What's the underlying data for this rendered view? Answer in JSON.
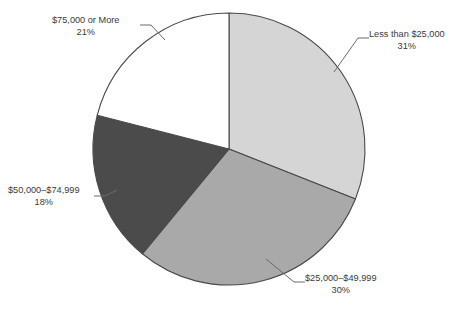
{
  "chart_data": {
    "type": "pie",
    "title": "",
    "subtitle": "",
    "xlabel": "",
    "ylabel": "",
    "legend_position": "none",
    "grid": false,
    "start_angle_deg": 0,
    "direction": "clockwise",
    "categories": [
      "Less than $25,000",
      "$25,000–$49,999",
      "$50,000–$74,999",
      "$75,000 or More"
    ],
    "values": [
      31,
      30,
      18,
      21
    ],
    "value_labels": [
      "31%",
      "30%",
      "18%",
      "21%"
    ],
    "colors": [
      "#d5d5d5",
      "#a9a9a9",
      "#4b4b4b",
      "#ffffff"
    ],
    "slices": [
      {
        "label": "Less than $25,000",
        "percent_label": "31%",
        "value": 31,
        "color": "#d5d5d5"
      },
      {
        "label": "$25,000–$49,999",
        "percent_label": "30%",
        "value": 30,
        "color": "#a9a9a9"
      },
      {
        "label": "$50,000–$74,999",
        "percent_label": "18%",
        "value": 18,
        "color": "#4b4b4b"
      },
      {
        "label": "$75,000 or More",
        "percent_label": "21%",
        "value": 21,
        "color": "#ffffff"
      }
    ]
  },
  "style": {
    "outline_color": "#4a4a4a",
    "text_color": "#3a3a3a",
    "background": "#ffffff",
    "leader_color": "#6b6b6b"
  }
}
